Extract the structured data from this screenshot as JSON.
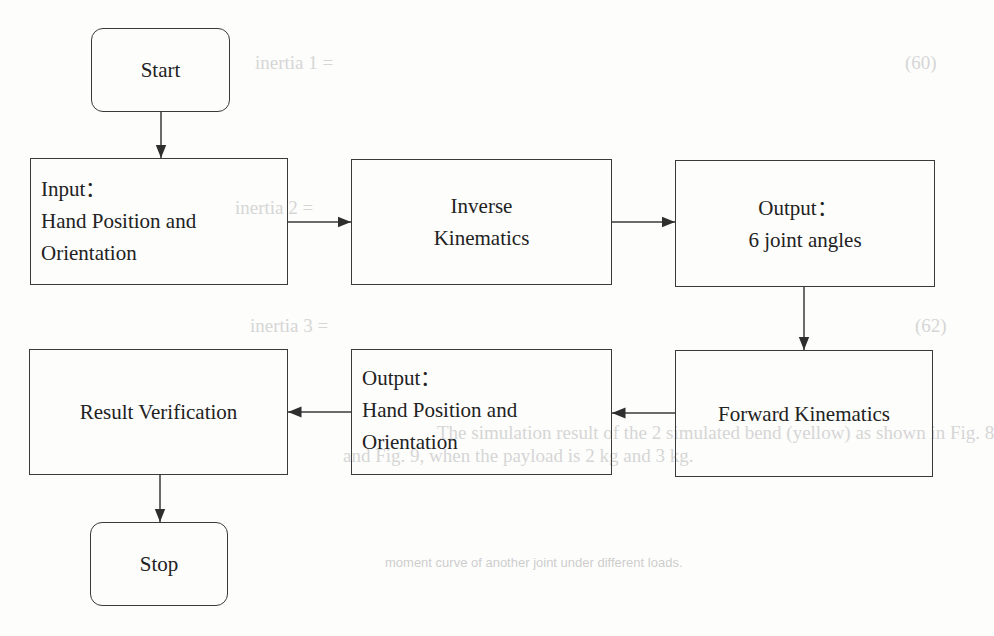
{
  "flowchart": {
    "start": {
      "label": "Start"
    },
    "input": {
      "lines": [
        "Input：",
        "Hand Position and",
        "Orientation"
      ]
    },
    "inverse": {
      "lines": [
        "Inverse",
        "Kinematics"
      ]
    },
    "joint_output": {
      "lines": [
        "Output：",
        "6 joint angles"
      ]
    },
    "forward": {
      "label": "Forward Kinematics"
    },
    "hand_output": {
      "lines": [
        "Output：",
        "Hand Position and",
        "Orientation"
      ]
    },
    "verification": {
      "label": "Result Verification"
    },
    "stop": {
      "label": "Stop"
    }
  },
  "ghost_text": {
    "g1": "inertia 1 =",
    "g2": "(60)",
    "g3": "inertia 2 =",
    "g4": "inertia 3 =",
    "g5": "(62)",
    "g6": "The simulation result of the 2 simulated bend (yellow) as shown in Fig. 8",
    "g7": "and Fig. 9, when the payload is 2 kg and 3 kg.",
    "g8": "moment curve of another joint under different loads."
  },
  "colors": {
    "stroke": "#3a3a3a",
    "text": "#222222",
    "background": "#fdfdfc"
  }
}
